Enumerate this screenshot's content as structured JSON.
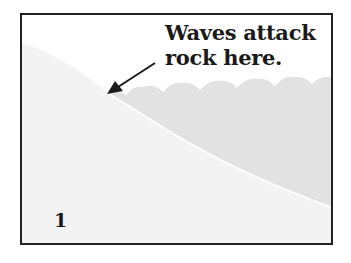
{
  "diagram": {
    "panel_number": "1",
    "caption": {
      "line1": "Waves attack",
      "line2": "rock here."
    },
    "elements": {
      "land": "sloping rock/land surface",
      "water": "sea with wavy surface",
      "arrow": "points to where waves meet the rock"
    },
    "colors": {
      "border": "#222222",
      "land": "#f3f3f3",
      "water": "#e2e2e2",
      "text": "#1a1a1a"
    }
  }
}
